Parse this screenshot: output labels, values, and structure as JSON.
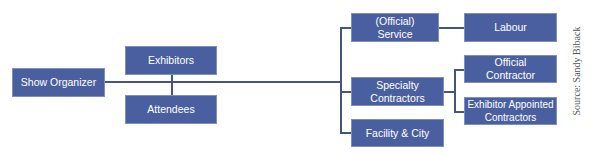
{
  "diagram": {
    "nodes": {
      "show_organizer": "Show Organizer",
      "exhibitors": "Exhibitors",
      "attendees": "Attendees",
      "general_contractor": "General (Official) Service Contractor",
      "labour": "Labour",
      "specialty_contractors": "Specialty Contractors",
      "facility_city": "Facility & City",
      "official_contractor": "Official Contractor",
      "exhibitor_appointed": "Exhibitor Appointed Contractors"
    },
    "source": "Source: Sandy Biback",
    "colors": {
      "node_fill": "#4a5f9f",
      "line": "#46557f",
      "text": "#ffffff"
    }
  }
}
